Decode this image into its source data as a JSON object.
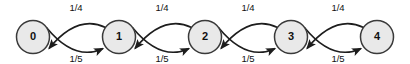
{
  "diagram": {
    "type": "state-transition-diagram",
    "title": "",
    "background_color": "#ffffff",
    "node_fill_color": "#e9e9e9",
    "node_stroke_color": "#3a3a3a",
    "edge_color": "#1d1d1d",
    "label_color": "#111111",
    "nodes": [
      {
        "id": "0",
        "label": "0",
        "cx": 33,
        "cy": 37,
        "r": 16.5
      },
      {
        "id": "1",
        "label": "1",
        "cx": 119,
        "cy": 37,
        "r": 16.5
      },
      {
        "id": "2",
        "label": "2",
        "cx": 205,
        "cy": 37,
        "r": 16.5
      },
      {
        "id": "3",
        "label": "3",
        "cx": 291,
        "cy": 37,
        "r": 16.5
      },
      {
        "id": "4",
        "label": "4",
        "cx": 377,
        "cy": 37,
        "r": 16.5
      }
    ],
    "forward_edges": [
      {
        "from": "0",
        "to": "1",
        "label": "1/4",
        "label_x": 76,
        "label_y": 11
      },
      {
        "from": "1",
        "to": "2",
        "label": "1/4",
        "label_x": 162,
        "label_y": 11
      },
      {
        "from": "2",
        "to": "3",
        "label": "1/4",
        "label_x": 248,
        "label_y": 11
      },
      {
        "from": "3",
        "to": "4",
        "label": "1/4",
        "label_x": 338,
        "label_y": 11
      }
    ],
    "backward_edges": [
      {
        "from": "1",
        "to": "0",
        "label": "1/5",
        "label_x": 76,
        "label_y": 62
      },
      {
        "from": "2",
        "to": "1",
        "label": "1/5",
        "label_x": 162,
        "label_y": 62
      },
      {
        "from": "3",
        "to": "2",
        "label": "1/5",
        "label_x": 248,
        "label_y": 62
      },
      {
        "from": "4",
        "to": "3",
        "label": "1/5",
        "label_x": 338,
        "label_y": 62
      }
    ]
  }
}
